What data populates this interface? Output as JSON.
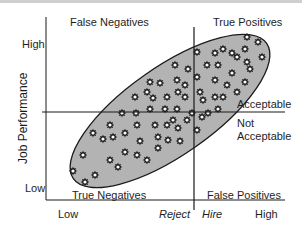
{
  "diagram": {
    "y_axis_label": "Job Performance",
    "y_ticks": {
      "high": "High",
      "low": "Low"
    },
    "x_ticks": {
      "low": "Low",
      "reject": "Reject",
      "hire": "Hire",
      "high": "High"
    },
    "quadrants": {
      "top_left": "False Negatives",
      "top_right": "True Positives",
      "bottom_left": "True Negatives",
      "bottom_right": "False Positives"
    },
    "criterion_labels": {
      "above": "Acceptable",
      "below_line1": "Not",
      "below_line2": "Acceptable"
    },
    "colors": {
      "ellipse_fill": "#b3b3b3",
      "ellipse_stroke": "#1a1a1a",
      "lines": "#1a1a1a",
      "marker_fill": "#ffffff",
      "marker_stroke": "#1a1a1a"
    },
    "ellipse": {
      "cx": 170,
      "cy": 111,
      "rx": 118,
      "ry": 44,
      "rotation_deg": -35
    },
    "markers": [
      [
        247,
        37
      ],
      [
        258,
        42
      ],
      [
        197,
        52
      ],
      [
        215,
        53
      ],
      [
        223,
        49
      ],
      [
        232,
        53
      ],
      [
        237,
        57
      ],
      [
        245,
        49
      ],
      [
        262,
        57
      ],
      [
        247,
        62
      ],
      [
        250,
        69
      ],
      [
        175,
        65
      ],
      [
        188,
        69
      ],
      [
        207,
        65
      ],
      [
        218,
        65
      ],
      [
        232,
        73
      ],
      [
        197,
        77
      ],
      [
        150,
        82
      ],
      [
        160,
        83
      ],
      [
        177,
        80
      ],
      [
        185,
        85
      ],
      [
        215,
        80
      ],
      [
        227,
        85
      ],
      [
        245,
        82
      ],
      [
        237,
        92
      ],
      [
        200,
        92
      ],
      [
        203,
        100
      ],
      [
        215,
        97
      ],
      [
        223,
        97
      ],
      [
        147,
        92
      ],
      [
        153,
        98
      ],
      [
        167,
        97
      ],
      [
        178,
        92
      ],
      [
        185,
        97
      ],
      [
        135,
        97
      ],
      [
        150,
        109
      ],
      [
        165,
        109
      ],
      [
        177,
        109
      ],
      [
        122,
        113
      ],
      [
        136,
        113
      ],
      [
        192,
        113
      ],
      [
        202,
        117
      ],
      [
        208,
        113
      ],
      [
        218,
        109
      ],
      [
        110,
        125
      ],
      [
        137,
        125
      ],
      [
        155,
        125
      ],
      [
        167,
        125
      ],
      [
        173,
        120
      ],
      [
        178,
        128
      ],
      [
        187,
        120
      ],
      [
        197,
        130
      ],
      [
        93,
        133
      ],
      [
        103,
        139
      ],
      [
        113,
        137
      ],
      [
        125,
        133
      ],
      [
        140,
        141
      ],
      [
        158,
        137
      ],
      [
        168,
        140
      ],
      [
        180,
        141
      ],
      [
        125,
        152
      ],
      [
        137,
        155
      ],
      [
        158,
        148
      ],
      [
        147,
        160
      ],
      [
        110,
        160
      ],
      [
        118,
        167
      ],
      [
        83,
        155
      ],
      [
        73,
        171
      ],
      [
        85,
        182
      ],
      [
        95,
        175
      ]
    ]
  }
}
